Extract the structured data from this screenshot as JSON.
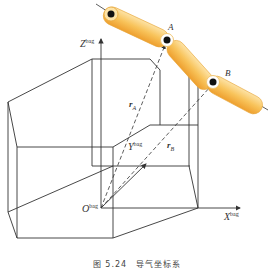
{
  "figure": {
    "caption": "图 5.24　导气坐标系"
  },
  "labels": {
    "z_axis": "Z",
    "z_sup": "bag",
    "y_axis": "Y",
    "y_sup": "bag",
    "x_axis": "X",
    "x_sup": "bag",
    "origin": "O",
    "origin_sup": "bag",
    "point_a": "A",
    "point_b": "B",
    "vector_a": "r",
    "vector_a_sub": "A",
    "vector_b": "r",
    "vector_b_sub": "B"
  },
  "colors": {
    "line": "#333333",
    "tube_fill": "#f7c15a",
    "tube_light": "#fde3a6",
    "tube_stroke": "#e7a73a",
    "joint": "#111111"
  }
}
